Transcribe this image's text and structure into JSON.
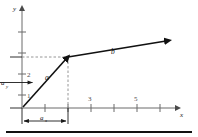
{
  "figure": {
    "type": "vector-components-diagram",
    "axes": {
      "x_label": "x",
      "y_label": "y",
      "x_ticks": [
        {
          "value": "1",
          "show_label": false
        },
        {
          "value": "2",
          "show_label": false
        },
        {
          "value": "3",
          "show_label": true
        },
        {
          "value": "4",
          "show_label": false
        },
        {
          "value": "5",
          "show_label": true
        },
        {
          "value": "6",
          "show_label": false
        }
      ],
      "y_ticks": [
        {
          "value": "1",
          "show_label": true
        },
        {
          "value": "2",
          "show_label": true
        },
        {
          "value": "3",
          "show_label": false
        },
        {
          "value": "4",
          "show_label": false
        }
      ],
      "x_tick_labels": [
        "3",
        "5"
      ],
      "y_tick_labels": [
        "2",
        "1"
      ]
    },
    "vectors": [
      {
        "name": "a",
        "label": "a",
        "tail": "origin",
        "head_x": "3",
        "head_y": "2"
      },
      {
        "name": "b",
        "label": "b",
        "tail": "head of a",
        "head_x": "6.5",
        "head_y": "2.6"
      }
    ],
    "component_labels": {
      "x_component": "a",
      "x_component_sub": "x",
      "y_component": "a",
      "y_component_sub": "y"
    },
    "colors": {
      "vector": "#111111",
      "axis": "#6b6b6b",
      "dashed": "#8a8a8a",
      "tick_label": "#4a4a4a",
      "background": "#ffffff",
      "rule": "#111111"
    }
  }
}
